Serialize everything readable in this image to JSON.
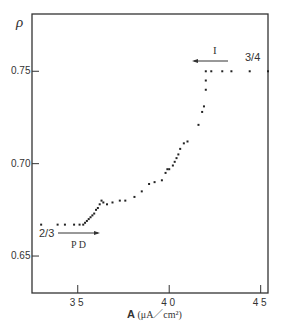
{
  "chart_data": {
    "type": "scatter",
    "title": "",
    "ylabel": "ρ",
    "xlabel": "A (μA/cm²)",
    "xlim": [
      32.5,
      45.4
    ],
    "ylim": [
      0.63,
      0.781
    ],
    "grid": false,
    "x_ticks": [
      35,
      40,
      45
    ],
    "x_tick_labels": [
      "3 5",
      "4 0",
      "4 5"
    ],
    "y_ticks": [
      0.65,
      0.7,
      0.75
    ],
    "y_tick_labels": [
      "0.65",
      "0.70",
      "0.75"
    ],
    "annotations": [
      {
        "text": "2/3",
        "x": 33.0,
        "y": 0.663
      },
      {
        "text": "P D",
        "x": 35.2,
        "y": 0.656,
        "arrow": "right"
      },
      {
        "text": "I",
        "x": 42.4,
        "y": 0.761,
        "arrow": "left"
      },
      {
        "text": "3/4",
        "x": 44.4,
        "y": 0.756
      }
    ],
    "series": [
      {
        "name": "ρ vs A",
        "points": [
          [
            33.0,
            0.667
          ],
          [
            33.9,
            0.667
          ],
          [
            34.3,
            0.667
          ],
          [
            34.8,
            0.667
          ],
          [
            35.1,
            0.667
          ],
          [
            35.3,
            0.667
          ],
          [
            35.4,
            0.668
          ],
          [
            35.5,
            0.669
          ],
          [
            35.6,
            0.67
          ],
          [
            35.7,
            0.671
          ],
          [
            35.8,
            0.672
          ],
          [
            35.9,
            0.673
          ],
          [
            36.0,
            0.675
          ],
          [
            36.1,
            0.676
          ],
          [
            36.2,
            0.678
          ],
          [
            36.3,
            0.68
          ],
          [
            36.4,
            0.679
          ],
          [
            36.6,
            0.678
          ],
          [
            36.9,
            0.679
          ],
          [
            37.3,
            0.68
          ],
          [
            37.6,
            0.68
          ],
          [
            38.1,
            0.682
          ],
          [
            38.5,
            0.685
          ],
          [
            38.9,
            0.689
          ],
          [
            39.2,
            0.69
          ],
          [
            39.6,
            0.691
          ],
          [
            39.8,
            0.695
          ],
          [
            39.9,
            0.697
          ],
          [
            40.0,
            0.697
          ],
          [
            40.2,
            0.699
          ],
          [
            40.3,
            0.701
          ],
          [
            40.4,
            0.703
          ],
          [
            40.5,
            0.705
          ],
          [
            40.6,
            0.708
          ],
          [
            40.8,
            0.711
          ],
          [
            41.0,
            0.712
          ],
          [
            41.6,
            0.721
          ],
          [
            41.8,
            0.728
          ],
          [
            41.9,
            0.731
          ],
          [
            42.0,
            0.74
          ],
          [
            42.0,
            0.745
          ],
          [
            42.0,
            0.75
          ],
          [
            42.3,
            0.75
          ],
          [
            42.9,
            0.75
          ],
          [
            43.4,
            0.75
          ],
          [
            44.4,
            0.75
          ],
          [
            45.4,
            0.75
          ]
        ]
      }
    ]
  }
}
